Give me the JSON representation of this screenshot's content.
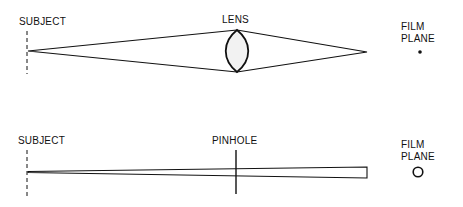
{
  "diagrams": [
    {
      "name": "lens-system",
      "subject_label": "SUBJECT",
      "optic_label": "LENS",
      "film_label_line1": "FILM",
      "film_label_line2": "PLANE",
      "film_marker": "point"
    },
    {
      "name": "pinhole-system",
      "subject_label": "SUBJECT",
      "optic_label": "PINHOLE",
      "film_label_line1": "FILM",
      "film_label_line2": "PLANE",
      "film_marker": "circle"
    }
  ],
  "colors": {
    "stroke": "#111111",
    "background": "#ffffff",
    "lens_fill": "#f2f2f2"
  }
}
